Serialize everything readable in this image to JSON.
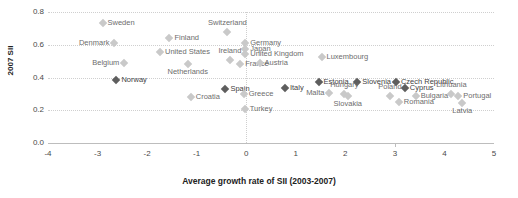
{
  "chart_data": {
    "type": "scatter",
    "title": "",
    "xlabel": "Average growth rate of SII (2003-2007)",
    "ylabel": "2007 SII",
    "xlim": [
      -4,
      5
    ],
    "ylim": [
      0.0,
      0.8
    ],
    "xticks": [
      "-4",
      "-3",
      "-2",
      "-1",
      "0",
      "1",
      "2",
      "3",
      "4",
      "5"
    ],
    "yticks": [
      "0.0",
      "0.2",
      "0.4",
      "0.6",
      "0.8"
    ],
    "grid": "horizontal-dotted-and-zero-vertical",
    "legend": "none",
    "marker": "diamond",
    "colors": {
      "dark_marker": "#5e5e5e",
      "light_marker": "#c9c9c9",
      "dark_label": "#3f3f3f",
      "light_label": "#6d6d6d",
      "gridline": "#cfcfcf",
      "axis": "#bdbdbd"
    },
    "points": [
      {
        "name": "Sweden",
        "x": -2.9,
        "y": 0.735,
        "tone": "light",
        "label_pos": "right"
      },
      {
        "name": "Denmark",
        "x": -2.66,
        "y": 0.61,
        "tone": "light",
        "label_pos": "left"
      },
      {
        "name": "Finland",
        "x": -1.55,
        "y": 0.64,
        "tone": "light",
        "label_pos": "right"
      },
      {
        "name": "United States",
        "x": -1.74,
        "y": 0.555,
        "tone": "light",
        "label_pos": "right"
      },
      {
        "name": "Switzerland",
        "x": -0.38,
        "y": 0.68,
        "tone": "light",
        "label_pos": "above"
      },
      {
        "name": "Germany",
        "x": -0.02,
        "y": 0.61,
        "tone": "light",
        "label_pos": "right"
      },
      {
        "name": "Japan",
        "x": -0.02,
        "y": 0.575,
        "tone": "light",
        "label_pos": "right"
      },
      {
        "name": "United Kingdom",
        "x": -0.02,
        "y": 0.545,
        "tone": "light",
        "label_pos": "right"
      },
      {
        "name": "Ireland",
        "x": -0.33,
        "y": 0.505,
        "tone": "light",
        "label_pos": "above"
      },
      {
        "name": "France",
        "x": -0.12,
        "y": 0.48,
        "tone": "light",
        "label_pos": "right"
      },
      {
        "name": "Austria",
        "x": 0.27,
        "y": 0.49,
        "tone": "light",
        "label_pos": "right"
      },
      {
        "name": "Belgium",
        "x": -2.46,
        "y": 0.49,
        "tone": "light",
        "label_pos": "left"
      },
      {
        "name": "Netherlands",
        "x": -1.18,
        "y": 0.48,
        "tone": "light",
        "label_pos": "below"
      },
      {
        "name": "Luxembourg",
        "x": 1.52,
        "y": 0.525,
        "tone": "light",
        "label_pos": "right"
      },
      {
        "name": "Norway",
        "x": -2.62,
        "y": 0.385,
        "tone": "dark",
        "label_pos": "right"
      },
      {
        "name": "Spain",
        "x": -0.42,
        "y": 0.33,
        "tone": "dark",
        "label_pos": "right"
      },
      {
        "name": "Croatia",
        "x": -1.12,
        "y": 0.28,
        "tone": "light",
        "label_pos": "right"
      },
      {
        "name": "Greece",
        "x": -0.05,
        "y": 0.3,
        "tone": "light",
        "label_pos": "right"
      },
      {
        "name": "Turkey",
        "x": -0.03,
        "y": 0.205,
        "tone": "light",
        "label_pos": "right"
      },
      {
        "name": "Italy",
        "x": 0.78,
        "y": 0.335,
        "tone": "dark",
        "label_pos": "right"
      },
      {
        "name": "Estonia",
        "x": 1.46,
        "y": 0.37,
        "tone": "dark",
        "label_pos": "right"
      },
      {
        "name": "Malta",
        "x": 1.68,
        "y": 0.305,
        "tone": "light",
        "label_pos": "left"
      },
      {
        "name": "Slovenia",
        "x": 2.24,
        "y": 0.37,
        "tone": "dark",
        "label_pos": "right"
      },
      {
        "name": "Hungary",
        "x": 1.98,
        "y": 0.3,
        "tone": "light",
        "label_pos": "above"
      },
      {
        "name": "Slovakia",
        "x": 2.05,
        "y": 0.29,
        "tone": "light",
        "label_pos": "below"
      },
      {
        "name": "Czech Republic",
        "x": 3.02,
        "y": 0.375,
        "tone": "dark",
        "label_pos": "right"
      },
      {
        "name": "Cyprus",
        "x": 3.2,
        "y": 0.335,
        "tone": "dark",
        "label_pos": "right"
      },
      {
        "name": "Poland",
        "x": 2.9,
        "y": 0.29,
        "tone": "light",
        "label_pos": "above"
      },
      {
        "name": "Bulgaria",
        "x": 3.42,
        "y": 0.285,
        "tone": "light",
        "label_pos": "right"
      },
      {
        "name": "Romania",
        "x": 3.08,
        "y": 0.25,
        "tone": "light",
        "label_pos": "right"
      },
      {
        "name": "Lithuania",
        "x": 4.14,
        "y": 0.3,
        "tone": "light",
        "label_pos": "above"
      },
      {
        "name": "Portugal",
        "x": 4.28,
        "y": 0.285,
        "tone": "light",
        "label_pos": "right"
      },
      {
        "name": "Latvia",
        "x": 4.36,
        "y": 0.245,
        "tone": "light",
        "label_pos": "below"
      }
    ]
  }
}
